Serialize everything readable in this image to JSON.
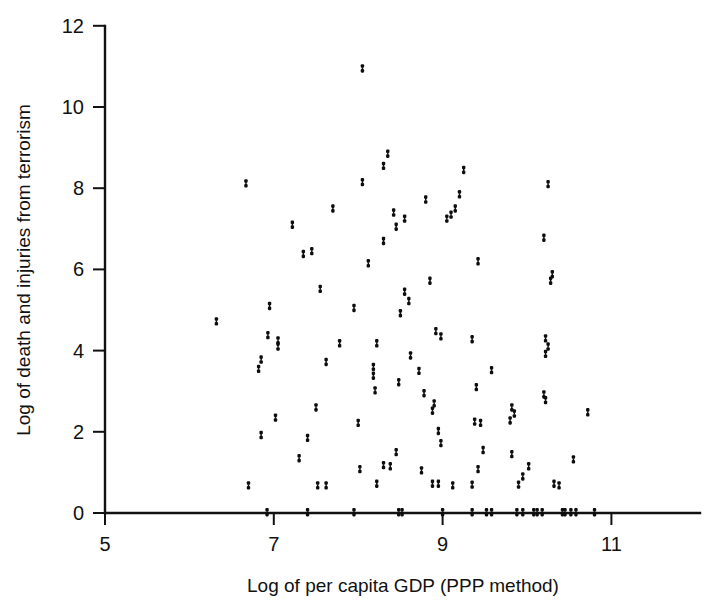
{
  "chart_data": {
    "type": "scatter",
    "title": "",
    "subtitle": "",
    "xlabel": "Log of per capita GDP (PPP method)",
    "ylabel": "Log of death and injuries from terrorism",
    "xlim": [
      5,
      11.9
    ],
    "ylim": [
      0,
      12
    ],
    "xticks": [
      5,
      7,
      9,
      11
    ],
    "xtick_labels": [
      "5",
      "7",
      "9",
      "11"
    ],
    "yticks": [
      0,
      2,
      4,
      6,
      8,
      10,
      12
    ],
    "ytick_labels": [
      "0",
      "2",
      "4",
      "6",
      "8",
      "10",
      "12"
    ],
    "grid": false,
    "legend": null,
    "marker": "small-vertical-dash",
    "marker_color": "#0d0d0d",
    "series": [
      {
        "name": "countries",
        "points": [
          [
            8.05,
            10.95
          ],
          [
            9.25,
            8.45
          ],
          [
            8.35,
            8.85
          ],
          [
            8.3,
            8.55
          ],
          [
            6.67,
            8.12
          ],
          [
            10.25,
            8.1
          ],
          [
            8.05,
            8.15
          ],
          [
            9.2,
            7.85
          ],
          [
            8.8,
            7.72
          ],
          [
            9.15,
            7.5
          ],
          [
            9.1,
            7.35
          ],
          [
            9.05,
            7.25
          ],
          [
            7.7,
            7.5
          ],
          [
            8.42,
            7.4
          ],
          [
            8.55,
            7.25
          ],
          [
            7.22,
            7.1
          ],
          [
            8.45,
            7.05
          ],
          [
            8.3,
            6.7
          ],
          [
            10.2,
            6.78
          ],
          [
            9.42,
            6.2
          ],
          [
            8.12,
            6.15
          ],
          [
            10.3,
            5.88
          ],
          [
            10.28,
            5.72
          ],
          [
            7.35,
            6.38
          ],
          [
            7.45,
            6.45
          ],
          [
            7.55,
            5.52
          ],
          [
            8.85,
            5.72
          ],
          [
            8.55,
            5.45
          ],
          [
            8.6,
            5.22
          ],
          [
            7.95,
            5.05
          ],
          [
            6.95,
            5.1
          ],
          [
            8.5,
            4.92
          ],
          [
            8.92,
            4.48
          ],
          [
            8.98,
            4.35
          ],
          [
            6.32,
            4.72
          ],
          [
            6.93,
            4.38
          ],
          [
            7.05,
            4.25
          ],
          [
            7.05,
            4.1
          ],
          [
            7.78,
            4.18
          ],
          [
            8.22,
            4.18
          ],
          [
            9.35,
            4.28
          ],
          [
            10.22,
            4.3
          ],
          [
            10.25,
            4.1
          ],
          [
            10.22,
            3.92
          ],
          [
            7.62,
            3.72
          ],
          [
            8.18,
            3.6
          ],
          [
            8.62,
            3.88
          ],
          [
            6.85,
            3.78
          ],
          [
            6.82,
            3.55
          ],
          [
            8.72,
            3.5
          ],
          [
            8.18,
            3.38
          ],
          [
            9.58,
            3.52
          ],
          [
            8.48,
            3.22
          ],
          [
            9.4,
            3.1
          ],
          [
            10.2,
            2.92
          ],
          [
            10.22,
            2.78
          ],
          [
            8.2,
            3.02
          ],
          [
            8.78,
            2.95
          ],
          [
            8.9,
            2.7
          ],
          [
            8.88,
            2.52
          ],
          [
            9.82,
            2.6
          ],
          [
            9.85,
            2.45
          ],
          [
            9.8,
            2.28
          ],
          [
            7.5,
            2.6
          ],
          [
            8.0,
            2.22
          ],
          [
            9.45,
            2.22
          ],
          [
            10.72,
            2.48
          ],
          [
            7.02,
            2.35
          ],
          [
            8.95,
            2.02
          ],
          [
            6.85,
            1.92
          ],
          [
            7.4,
            1.85
          ],
          [
            9.38,
            2.25
          ],
          [
            8.98,
            1.72
          ],
          [
            9.48,
            1.55
          ],
          [
            8.45,
            1.5
          ],
          [
            9.82,
            1.45
          ],
          [
            7.3,
            1.35
          ],
          [
            10.55,
            1.32
          ],
          [
            8.3,
            1.18
          ],
          [
            8.38,
            1.15
          ],
          [
            9.42,
            1.08
          ],
          [
            10.02,
            1.15
          ],
          [
            8.75,
            1.05
          ],
          [
            8.02,
            1.08
          ],
          [
            9.95,
            0.9
          ],
          [
            6.7,
            0.68
          ],
          [
            7.52,
            0.68
          ],
          [
            7.62,
            0.68
          ],
          [
            8.22,
            0.72
          ],
          [
            8.88,
            0.72
          ],
          [
            8.95,
            0.72
          ],
          [
            9.12,
            0.68
          ],
          [
            9.35,
            0.7
          ],
          [
            9.9,
            0.7
          ],
          [
            10.32,
            0.72
          ],
          [
            10.38,
            0.68
          ],
          [
            6.92,
            0.02
          ],
          [
            7.4,
            0.02
          ],
          [
            7.95,
            0.02
          ],
          [
            8.48,
            0.02
          ],
          [
            8.52,
            0.02
          ],
          [
            9.0,
            0.02
          ],
          [
            9.35,
            0.02
          ],
          [
            9.52,
            0.02
          ],
          [
            9.58,
            0.02
          ],
          [
            9.88,
            0.02
          ],
          [
            9.95,
            0.02
          ],
          [
            10.08,
            0.02
          ],
          [
            10.12,
            0.02
          ],
          [
            10.18,
            0.02
          ],
          [
            10.42,
            0.02
          ],
          [
            10.45,
            0.02
          ],
          [
            10.52,
            0.02
          ],
          [
            10.58,
            0.02
          ],
          [
            10.8,
            0.02
          ]
        ]
      }
    ]
  }
}
